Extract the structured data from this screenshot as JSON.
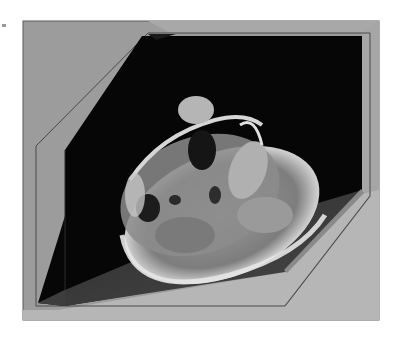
{
  "figure": {
    "colors": {
      "box_wall": "#9c9c9c",
      "box_floor": "#b4b4b4",
      "box_edge": "#555555",
      "plane_dark": "#050505",
      "plane_floor": "#3a3a3a",
      "tissue_light": "#d8d8d8",
      "tissue_mid": "#8a8a8a"
    }
  }
}
